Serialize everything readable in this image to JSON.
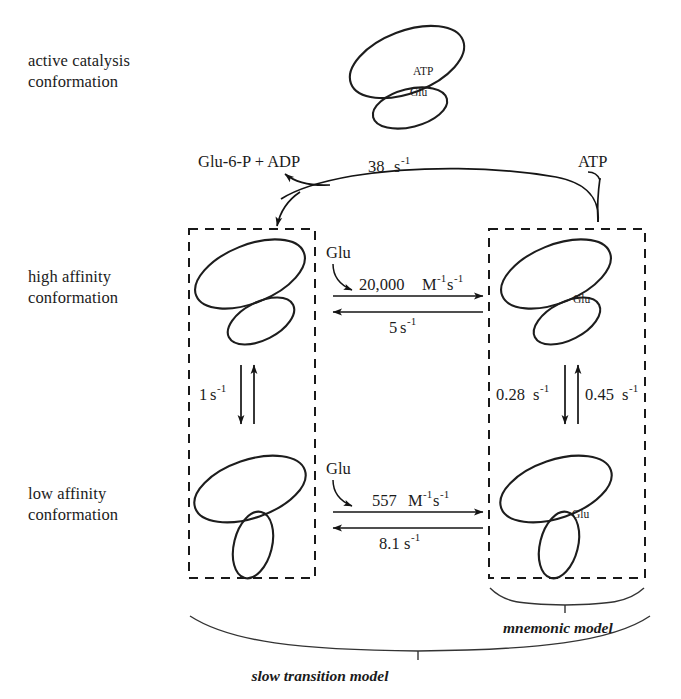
{
  "figure": {
    "title_implicit": "glucokinase conformational kinetic scheme",
    "row_labels": [
      {
        "id": "active-catalysis",
        "text": "active catalysis\nconformation"
      },
      {
        "id": "high-affinity",
        "text": "high affinity\nconformation"
      },
      {
        "id": "low-affinity",
        "text": "low affinity\nconformation"
      }
    ],
    "species": {
      "atp_top": "ATP",
      "glu_top": "Glu",
      "products": "Glu-6-P  + ADP",
      "atp_substrate": "ATP",
      "glu_high": "Glu",
      "glu_low": "Glu",
      "glu_bound_high": "Glu",
      "glu_bound_low": "Glu"
    },
    "rates": {
      "catalysis": {
        "value": "38",
        "unit_base": "s",
        "unit_exp": "-1",
        "full": "38 s-1"
      },
      "high_affinity_on": {
        "value": "20,000",
        "unit_base": "M",
        "unit_exp1": "-1",
        "unit_base2": "s",
        "unit_exp2": "-1",
        "full": "20,000 M-1s-1"
      },
      "high_affinity_off": {
        "value": "5",
        "unit_base": "s",
        "unit_exp": "-1",
        "full": "5 s-1"
      },
      "low_affinity_on": {
        "value": "557",
        "unit_base": "M",
        "unit_exp1": "-1",
        "unit_base2": "s",
        "unit_exp2": "-1",
        "full": "557 M-1s-1"
      },
      "low_affinity_off": {
        "value": "8.1",
        "unit_base": "s",
        "unit_exp": "-1",
        "full": "8.1 s-1"
      },
      "free_transition": {
        "value": "1",
        "unit_base": "s",
        "unit_exp": "-1",
        "full": "1 s-1"
      },
      "bound_transition_down": {
        "value": "0.28",
        "unit_base": "s",
        "unit_exp": "-1",
        "full": "0.28 s-1"
      },
      "bound_transition_up": {
        "value": "0.45",
        "unit_base": "s",
        "unit_exp": "-1",
        "full": "0.45 s-1"
      }
    },
    "model_braces": [
      {
        "id": "mnemonic",
        "label": "mnemonic model"
      },
      {
        "id": "slow-transition",
        "label": "slow transition model"
      }
    ],
    "colors": {
      "ink": "#1b1b1b",
      "shape_stroke": "#1d1d1d",
      "background": "#ffffff"
    }
  }
}
